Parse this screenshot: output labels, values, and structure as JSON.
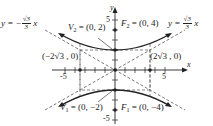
{
  "diagram": {
    "type": "hyperbola",
    "equation": "y^2/4 - x^2/12 = 1",
    "axes": {
      "x_label": "x",
      "y_label": "y",
      "x_ticks": [
        "-5",
        "5"
      ],
      "y_ticks": [
        "5",
        "-5"
      ]
    },
    "labels": {
      "asym_left_prefix": "y = −",
      "asym_num": "√3",
      "asym_den": "3",
      "asym_suffix": " x",
      "asym_right_prefix": "y = ",
      "v2": "V",
      "v2_sub": "2",
      "v2_val": " = (0, 2)",
      "f2": "F",
      "f2_sub": "2",
      "f2_val": " = (0, 4)",
      "v1": "V",
      "v1_sub": "1",
      "v1_val": " = (0, −2)",
      "f1": "F",
      "f1_sub": "1",
      "f1_val": " = (0, −4)",
      "pt_left": "(−2√3 , 0)",
      "pt_right": "(2√3 , 0)"
    },
    "colors": {
      "stroke": "#222222",
      "dashed": "#555555"
    }
  }
}
